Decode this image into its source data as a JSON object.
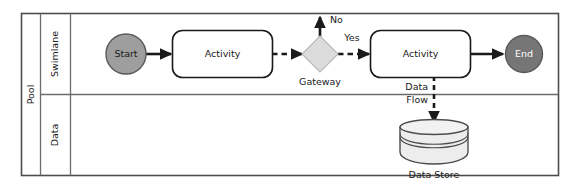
{
  "diagram": {
    "type": "bpmn-process-diagram",
    "pool": {
      "label": "Pool",
      "lanes": [
        {
          "id": "swimlane",
          "label": "Swimlane"
        },
        {
          "id": "data",
          "label": "Data"
        }
      ]
    },
    "nodes": {
      "start_event": {
        "label": "Start",
        "shape": "circle",
        "fill": "#9e9e9e",
        "stroke": "#595959"
      },
      "activity_1": {
        "label": "Activity",
        "shape": "rounded-rect",
        "fill": "#ffffff",
        "stroke": "#1a1a1a"
      },
      "gateway": {
        "label": "Gateway",
        "shape": "diamond",
        "fill": "#dcdcdc",
        "stroke": "#b0b0b0"
      },
      "activity_2": {
        "label": "Activity",
        "shape": "rounded-rect",
        "fill": "#ffffff",
        "stroke": "#1a1a1a"
      },
      "end_event": {
        "label": "End",
        "shape": "circle",
        "fill": "#767676",
        "stroke": "#595959"
      },
      "data_store": {
        "label": "Data Store",
        "shape": "cylinder",
        "fill": "#ededed",
        "stroke": "#4d4d4d"
      }
    },
    "flows": {
      "start_to_activity1": {
        "label": "",
        "style": "solid"
      },
      "activity1_to_gateway": {
        "label": "",
        "style": "dashed"
      },
      "gateway_no": {
        "label": "No",
        "style": "solid"
      },
      "gateway_yes": {
        "label": "Yes",
        "style": "dashed"
      },
      "activity2_to_end": {
        "label": "",
        "style": "solid"
      },
      "data_flow": {
        "label_line1": "Data",
        "label_line2": "Flow",
        "style": "dashed"
      }
    },
    "colors": {
      "frame": "#4d4d4d",
      "divider": "#6b6b6b",
      "background": "#ffffff",
      "arrow": "#1a1a1a"
    }
  }
}
